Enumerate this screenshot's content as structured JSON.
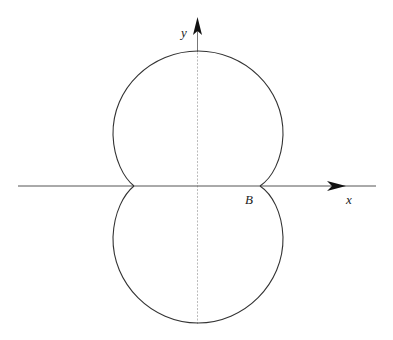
{
  "diagram": {
    "type": "polar-curve-sketch",
    "axes": {
      "x_label": "x",
      "y_label": "y"
    },
    "points": {
      "B": {
        "label": "B",
        "position": "right cusp on x-axis"
      }
    },
    "colors": {
      "curve": "#333333",
      "axis": "#555555",
      "axis_inner": "#bbbbbb",
      "background": "#ffffff"
    }
  }
}
